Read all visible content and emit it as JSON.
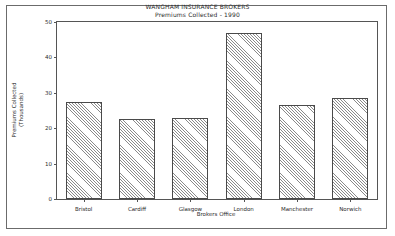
{
  "figure": {
    "title_main": "WANGHAM INSURANCE BROKERS",
    "title_sub": "Premiums Collected - 1990",
    "y_axis_title_line1": "Premiums Collected",
    "y_axis_title_line2": "(Thousands)",
    "x_axis_title": "Brokers Office",
    "frame_color": "#6b6b6b",
    "axis_color": "#555555",
    "bar_edge_color": "#4a4a4a",
    "bar_hatch_color": "#8a8a8a",
    "background_color": "#ffffff"
  },
  "chart_data": {
    "type": "bar",
    "title": "WANGHAM INSURANCE BROKERS",
    "subtitle": "Premiums Collected - 1990",
    "xlabel": "Brokers Office",
    "ylabel": "Premiums Collected (Thousands)",
    "categories": [
      "Bristol",
      "Cardiff",
      "Glasgow",
      "London",
      "Manchester",
      "Norwich"
    ],
    "values": [
      27.5,
      22.5,
      23,
      47,
      26.5,
      28.5
    ],
    "ylim": [
      0,
      50
    ],
    "yticks": [
      0,
      10,
      20,
      30,
      40,
      50
    ],
    "ytick_labels": [
      "0",
      "10",
      "20",
      "30",
      "40",
      "50"
    ],
    "grid": false,
    "legend": false
  }
}
